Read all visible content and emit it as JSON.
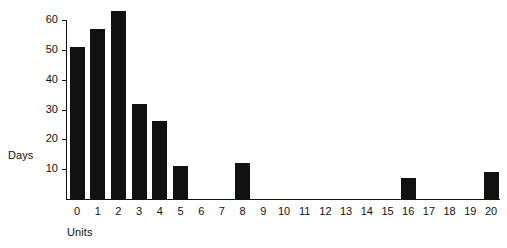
{
  "chart_data": {
    "type": "bar",
    "title": "",
    "subtitle": "",
    "xlabel": "Units",
    "ylabel": "Days",
    "categories": [
      "0",
      "1",
      "2",
      "3",
      "4",
      "5",
      "6",
      "7",
      "8",
      "9",
      "10",
      "11",
      "12",
      "13",
      "14",
      "15",
      "16",
      "17",
      "18",
      "19",
      "20"
    ],
    "values": [
      51,
      57,
      63,
      32,
      26,
      11,
      0,
      0,
      12,
      0,
      0,
      0,
      0,
      0,
      0,
      0,
      7,
      0,
      0,
      0,
      9
    ],
    "x": [
      0,
      1,
      2,
      3,
      4,
      5,
      6,
      7,
      8,
      9,
      10,
      11,
      12,
      13,
      14,
      15,
      16,
      17,
      18,
      19,
      20
    ],
    "xlim": [
      -0.6,
      20.6
    ],
    "ylim": [
      0,
      63
    ],
    "y_ticks": [
      10,
      20,
      30,
      40,
      50,
      60
    ],
    "x_ticks": [
      "0",
      "1",
      "2",
      "3",
      "4",
      "5",
      "6",
      "7",
      "8",
      "9",
      "10",
      "11",
      "12",
      "13",
      "14",
      "15",
      "16",
      "17",
      "18",
      "19",
      "20"
    ],
    "grid": false,
    "legend": null,
    "legend_position": "none",
    "bar_color": "#111111",
    "background_color": "#ffffff",
    "axis_color": "#111111"
  }
}
